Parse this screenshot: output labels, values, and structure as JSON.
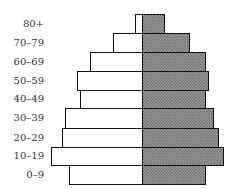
{
  "chart_data": {
    "type": "bar",
    "subtype": "population-pyramid",
    "title": "",
    "categories": [
      "80+",
      "70-79",
      "60-69",
      "50-59",
      "40-49",
      "30-39",
      "20-29",
      "10-19",
      "0-9"
    ],
    "series": [
      {
        "name": "Left (white)",
        "values": [
          7,
          29,
          52,
          65,
          62,
          77,
          80,
          91,
          73
        ]
      },
      {
        "name": "Right (shaded)",
        "values": [
          23,
          48,
          64,
          67,
          64,
          72,
          77,
          82,
          64
        ]
      }
    ],
    "units": "pixel-relative width (no axis shown)",
    "xlabel": "",
    "ylabel": "",
    "grid": false,
    "legend": null
  },
  "labels": [
    "80+",
    "70–79",
    "60–69",
    "50–59",
    "40–49",
    "30–39",
    "20–29",
    "10–19",
    "0–9"
  ]
}
